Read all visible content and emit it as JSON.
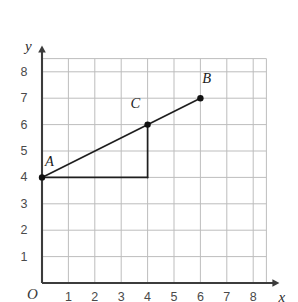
{
  "figure": {
    "type": "coordinate-plane-graph",
    "background_color": "#ffffff",
    "grid_color": "#bdbdbd",
    "axis_color": "#3c3c3c",
    "segment_color": "#1f1f1f",
    "point_color": "#111111"
  },
  "axes": {
    "x_name": "x",
    "y_name": "y",
    "origin_label": "O",
    "x_ticks": [
      "1",
      "2",
      "3",
      "4",
      "5",
      "6",
      "7",
      "8"
    ],
    "y_ticks": [
      "1",
      "2",
      "3",
      "4",
      "5",
      "6",
      "7",
      "8"
    ],
    "x_range": [
      0,
      8.5
    ],
    "y_range": [
      0,
      8.5
    ],
    "grid": true,
    "grid_step": 1,
    "x_arrow": true,
    "y_arrow": true
  },
  "chart_data": {
    "type": "scatter",
    "title": "",
    "xlabel": "x",
    "ylabel": "y",
    "xlim": [
      0,
      8.5
    ],
    "ylim": [
      0,
      8.5
    ],
    "grid": true,
    "legend": "none",
    "points": [
      {
        "label": "A",
        "x": 0,
        "y": 4,
        "label_dx": 0.3,
        "label_dy": 0.62
      },
      {
        "label": "C",
        "x": 4,
        "y": 6,
        "label_dx": -0.46,
        "label_dy": 0.8
      },
      {
        "label": "B",
        "x": 6,
        "y": 7,
        "label_dx": 0.26,
        "label_dy": 0.78
      }
    ],
    "segments": [
      {
        "name": "hypotenuse-a-to-b",
        "x1": 0,
        "y1": 4,
        "x2": 6,
        "y2": 7,
        "style": "solid"
      },
      {
        "name": "vertical-leg-c",
        "x1": 4,
        "y1": 6,
        "x2": 4,
        "y2": 4,
        "style": "solid"
      },
      {
        "name": "horizontal-leg-a",
        "x1": 0,
        "y1": 4,
        "x2": 4,
        "y2": 4,
        "style": "solid"
      }
    ],
    "slope": 0.5
  }
}
